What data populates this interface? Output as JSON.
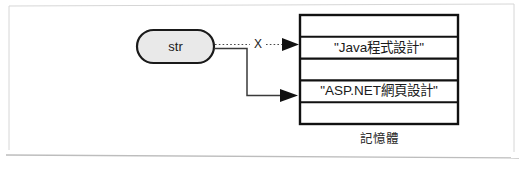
{
  "figure": {
    "kind": "memory-reference-diagram",
    "background_color": "#ffffff",
    "frame_color": "#d6d6d6"
  },
  "variable": {
    "label": "str",
    "shape": "rounded-capsule",
    "fill_color": "#e9e9e9",
    "stroke_color": "#1a1a1a"
  },
  "edges": {
    "broken_link": {
      "style": "dotted",
      "marker_label": "X",
      "description": "severed reference from str to old string object"
    },
    "active_link": {
      "style": "solid",
      "description": "current reference from str to new string object"
    }
  },
  "memory": {
    "caption": "記憶體",
    "cells": [
      {
        "value": "",
        "highlighted": false
      },
      {
        "value": "\"Java程式設計\"",
        "highlighted": true
      },
      {
        "value": "",
        "highlighted": false
      },
      {
        "value": "\"ASP.NET網頁設計\"",
        "highlighted": true
      },
      {
        "value": "",
        "highlighted": false
      }
    ]
  }
}
